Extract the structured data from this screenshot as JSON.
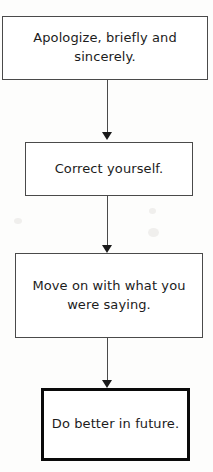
{
  "diagram": {
    "type": "flowchart",
    "orientation": "top-to-bottom",
    "background_color": "#fdfdfc",
    "nodes": [
      {
        "id": "node-1",
        "label": "Apologize, briefly and sincerely.",
        "shape": "rectangle",
        "emphasis": "normal",
        "border_color": "#4a4a4a",
        "fill_color": "#ffffff"
      },
      {
        "id": "node-2",
        "label": "Correct yourself.",
        "shape": "rectangle",
        "emphasis": "normal",
        "border_color": "#4a4a4a",
        "fill_color": "#ffffff"
      },
      {
        "id": "node-3",
        "label": "Move on with what you were saying.",
        "shape": "rectangle",
        "emphasis": "normal",
        "border_color": "#4a4a4a",
        "fill_color": "#ffffff"
      },
      {
        "id": "node-4",
        "label": "Do better in future.",
        "shape": "rectangle",
        "emphasis": "bold",
        "border_color": "#0a0a0a",
        "fill_color": "#ffffff"
      }
    ],
    "edges": [
      {
        "id": "edge-1",
        "from": "node-1",
        "to": "node-2",
        "style": "solid",
        "arrow": "down"
      },
      {
        "id": "edge-2",
        "from": "node-2",
        "to": "node-3",
        "style": "solid",
        "arrow": "down"
      },
      {
        "id": "edge-3",
        "from": "node-3",
        "to": "node-4",
        "style": "solid",
        "arrow": "down"
      }
    ]
  }
}
